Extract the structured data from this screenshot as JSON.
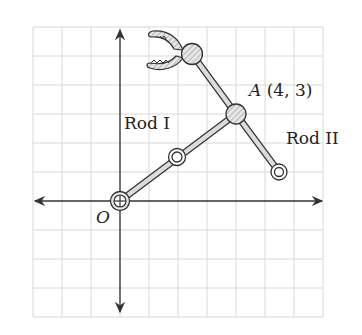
{
  "diagram": {
    "type": "robotic arm on coordinate grid",
    "grid": {
      "unit_px": 29,
      "origin_px": [
        120,
        201
      ],
      "x_range": [
        -3,
        7
      ],
      "y_range": [
        -4,
        6
      ]
    },
    "labels": {
      "origin": "O",
      "point_a_name": "A",
      "point_a_coords": "(4, 3)",
      "rod1": "Rod I",
      "rod2": "Rod II"
    },
    "points": {
      "origin": [
        0,
        0
      ],
      "rod1_mid_joint": [
        2,
        1.5
      ],
      "A": [
        4,
        3
      ],
      "gripper_joint": [
        2.5,
        5.1
      ],
      "rod2_end": [
        5.5,
        1
      ]
    },
    "colors": {
      "grid": "#d8d8d8",
      "axis": "#333333",
      "rod_fill": "#d9d9d9",
      "stroke": "#333333"
    }
  }
}
